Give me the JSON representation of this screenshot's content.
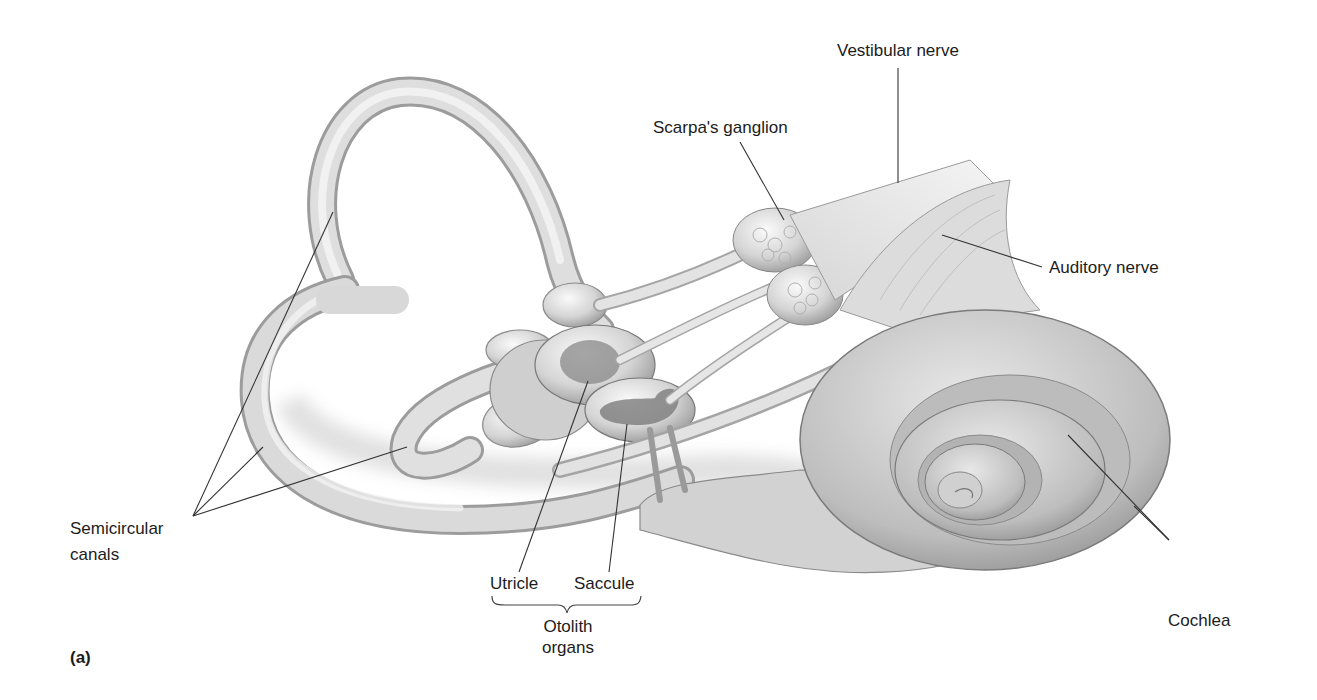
{
  "figure": {
    "panel_label": "(a)",
    "colors": {
      "background": "#ffffff",
      "tissue_light": "#efefef",
      "tissue_mid": "#c9c9c9",
      "tissue_dark": "#8c8c8c",
      "otolith_macula": "#7d7d7d",
      "label_text": "#1c1c1c",
      "leader_line": "#333333"
    }
  },
  "labels": {
    "vestibular_nerve": "Vestibular nerve",
    "scarpas_ganglion": "Scarpa's ganglion",
    "auditory_nerve": "Auditory nerve",
    "semicircular_canals_line1": "Semicircular",
    "semicircular_canals_line2": "canals",
    "utricle": "Utricle",
    "saccule": "Saccule",
    "otolith_organs_line1": "Otolith",
    "otolith_organs_line2": "organs",
    "cochlea": "Cochlea"
  },
  "structures": [
    {
      "name": "Semicircular canals",
      "count": 3
    },
    {
      "name": "Utricle",
      "group": "Otolith organs"
    },
    {
      "name": "Saccule",
      "group": "Otolith organs"
    },
    {
      "name": "Scarpa's ganglion"
    },
    {
      "name": "Vestibular nerve"
    },
    {
      "name": "Auditory nerve"
    },
    {
      "name": "Cochlea"
    }
  ]
}
